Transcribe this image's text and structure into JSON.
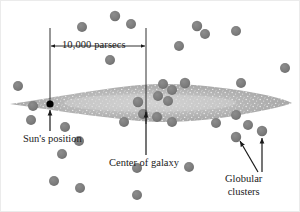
{
  "figure": {
    "background_color": "#ffffff",
    "frame_color": "#e8e8e8",
    "width": 300,
    "height": 212
  },
  "labels": {
    "scale": "10,000 parsecs",
    "sun": "Sun's position",
    "center": "Center of galaxy",
    "globular_line1": "Globular",
    "globular_line2": "clusters"
  },
  "colors": {
    "cluster_dot": "#7d7d7d",
    "cluster_dot_edge": "#6e6e6e",
    "galaxy_disk": "#a8a8a8",
    "galaxy_disk_light": "#c9c9c9",
    "galaxy_speckle": "#e6e6e6",
    "sun_dot": "#000000",
    "line": "#1a1a1a",
    "text": "#1a1a1a"
  },
  "chart_data": {
    "type": "scatter",
    "xlabel": "",
    "ylabel": "",
    "annotations": [
      {
        "text": "10,000 parsecs",
        "kind": "double-arrow-scale-bar",
        "x1": 50,
        "x2": 146,
        "y": 46
      },
      {
        "text": "Sun's position",
        "kind": "arrow-callout",
        "target_x": 50,
        "target_y": 104
      },
      {
        "text": "Center of galaxy",
        "kind": "arrow-callout",
        "target_x": 146,
        "target_y": 108
      },
      {
        "text": "Globular clusters",
        "kind": "arrow-callout",
        "target_x": 236,
        "target_y": 137
      },
      {
        "text": "Globular clusters",
        "kind": "arrow-callout",
        "target_x": 262,
        "target_y": 131
      }
    ],
    "galaxy_disk": {
      "shape": "lens",
      "center_x": 150,
      "center_y": 103,
      "half_width": 140,
      "max_half_height": 13,
      "note": "speckled lens/spindle shape representing the galactic disk seen edge-on"
    },
    "sun": {
      "x": 50,
      "y": 104,
      "color": "#000000",
      "radius": 3.6
    },
    "center_of_galaxy": {
      "x": 146,
      "y": 105
    },
    "globular_clusters": [
      {
        "x": 115,
        "y": 16,
        "r": 5.2
      },
      {
        "x": 82,
        "y": 27,
        "r": 5.0
      },
      {
        "x": 131,
        "y": 24,
        "r": 5.0
      },
      {
        "x": 197,
        "y": 26,
        "r": 5.2
      },
      {
        "x": 205,
        "y": 34,
        "r": 5.0
      },
      {
        "x": 236,
        "y": 31,
        "r": 5.0
      },
      {
        "x": 179,
        "y": 46,
        "r": 5.0
      },
      {
        "x": 110,
        "y": 60,
        "r": 5.0
      },
      {
        "x": 285,
        "y": 68,
        "r": 5.0
      },
      {
        "x": 18,
        "y": 86,
        "r": 5.0
      },
      {
        "x": 185,
        "y": 83,
        "r": 5.2
      },
      {
        "x": 163,
        "y": 84,
        "r": 5.0
      },
      {
        "x": 172,
        "y": 90,
        "r": 5.0
      },
      {
        "x": 241,
        "y": 83,
        "r": 5.0
      },
      {
        "x": 33,
        "y": 106,
        "r": 5.0
      },
      {
        "x": 138,
        "y": 102,
        "r": 5.2
      },
      {
        "x": 158,
        "y": 96,
        "r": 5.0
      },
      {
        "x": 168,
        "y": 101,
        "r": 5.0
      },
      {
        "x": 236,
        "y": 115,
        "r": 5.0
      },
      {
        "x": 143,
        "y": 114,
        "r": 5.0
      },
      {
        "x": 124,
        "y": 122,
        "r": 5.0
      },
      {
        "x": 157,
        "y": 117,
        "r": 5.0
      },
      {
        "x": 31,
        "y": 120,
        "r": 5.0
      },
      {
        "x": 65,
        "y": 127,
        "r": 5.0
      },
      {
        "x": 172,
        "y": 122,
        "r": 5.0
      },
      {
        "x": 248,
        "y": 125,
        "r": 5.0
      },
      {
        "x": 79,
        "y": 141,
        "r": 5.0
      },
      {
        "x": 62,
        "y": 154,
        "r": 5.0
      },
      {
        "x": 236,
        "y": 137,
        "r": 5.2
      },
      {
        "x": 262,
        "y": 131,
        "r": 5.2
      },
      {
        "x": 54,
        "y": 181,
        "r": 5.0
      },
      {
        "x": 80,
        "y": 188,
        "r": 5.0
      },
      {
        "x": 137,
        "y": 195,
        "r": 5.0
      },
      {
        "x": 189,
        "y": 167,
        "r": 5.0
      },
      {
        "x": 137,
        "y": 168,
        "r": 5.0
      },
      {
        "x": 216,
        "y": 123,
        "r": 5.0
      }
    ]
  }
}
